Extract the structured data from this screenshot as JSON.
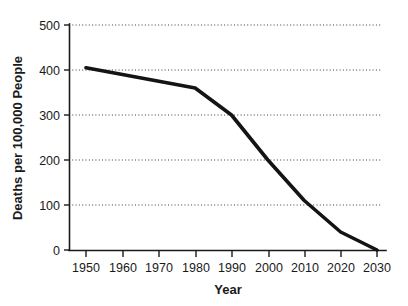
{
  "chart_data": {
    "type": "line",
    "title": "",
    "xlabel": "Year",
    "ylabel": "Deaths per 100,000 People",
    "x": [
      1950,
      1960,
      1970,
      1980,
      1990,
      2000,
      2010,
      2020,
      2030
    ],
    "values": [
      405,
      390,
      375,
      360,
      300,
      200,
      110,
      40,
      0
    ],
    "series": [
      {
        "name": "Deaths per 100,000 People",
        "values": [
          405,
          390,
          375,
          360,
          300,
          200,
          110,
          40,
          0
        ]
      }
    ],
    "xlim": [
      1950,
      2030
    ],
    "ylim": [
      0,
      500
    ],
    "x_ticks": [
      1950,
      1960,
      1970,
      1980,
      1990,
      2000,
      2010,
      2020,
      2030
    ],
    "x_tick_labels": [
      "1950",
      "1960",
      "1970",
      "1980",
      "1990",
      "2000",
      "2010",
      "2020",
      "2030"
    ],
    "y_ticks": [
      0,
      100,
      200,
      300,
      400,
      500
    ],
    "y_tick_labels": [
      "0",
      "100",
      "200",
      "300",
      "400",
      "500"
    ],
    "grid": "horizontal-dotted",
    "legend": "none",
    "line_color": "#141414",
    "background_color": "#ffffff",
    "annotations": []
  },
  "axes": {
    "y_title": "Deaths per 100,000 People",
    "x_title": "Year",
    "y_labels": [
      "500",
      "400",
      "300",
      "200",
      "100",
      "0"
    ],
    "x_labels": [
      "1950",
      "1960",
      "1970",
      "1980",
      "1990",
      "2000",
      "2010",
      "2020",
      "2030"
    ]
  }
}
